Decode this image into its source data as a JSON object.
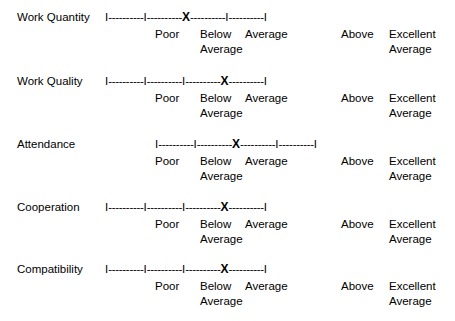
{
  "form": {
    "scale_points": [
      "Poor",
      "Below Average",
      "Average",
      "Above Average",
      "Excellent"
    ],
    "legend": {
      "poor": "Poor",
      "below": "Below",
      "below_second": "Average",
      "average": "Average",
      "above": "Above",
      "excellent": "Excellent",
      "excellent_second": "Average"
    },
    "mark_glyph": "X",
    "tick_glyph": "I",
    "segment_dashes": "----------",
    "rows": [
      {
        "criterion": "Work Quantity",
        "scale_left": 105,
        "top": 10,
        "selected_index": 2,
        "selected_label": "Average",
        "cells": [
          "I",
          "I",
          "X",
          "I",
          "I"
        ]
      },
      {
        "criterion": "Work Quality",
        "scale_left": 105,
        "top": 74,
        "selected_index": 3,
        "selected_label": "Above Average",
        "cells": [
          "I",
          "I",
          "I",
          "X",
          "I"
        ]
      },
      {
        "criterion": "Attendance",
        "scale_left": 155,
        "top": 137,
        "selected_index": 2,
        "selected_label": "Average",
        "cells": [
          "I",
          "I",
          "X",
          "I",
          "I"
        ]
      },
      {
        "criterion": "Cooperation",
        "scale_left": 105,
        "top": 200,
        "selected_index": 3,
        "selected_label": "Above Average",
        "cells": [
          "I",
          "I",
          "I",
          "X",
          "I"
        ]
      },
      {
        "criterion": "Compatibility",
        "scale_left": 105,
        "top": 262,
        "selected_index": 3,
        "selected_label": "Above Average",
        "cells": [
          "I",
          "I",
          "I",
          "X",
          "I"
        ]
      }
    ],
    "legend_positions": {
      "poor_x": 155,
      "below_x": 200,
      "below_second_x": 200,
      "average_x": 245,
      "above_x": 341,
      "excellent_x": 389,
      "excellent_second_x": 389
    }
  }
}
